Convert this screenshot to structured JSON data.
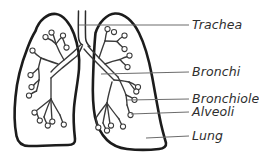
{
  "figure": {
    "background_color": "#ffffff",
    "outline_color": "#1c1c1c",
    "airway_color": "#3a3a3a",
    "leader_color": "#6d6d6d",
    "text_color": "#2e2e2e"
  },
  "labels": {
    "trachea": "Trachea",
    "bronchi": "Bronchi",
    "bronchioles": "Bronchioles",
    "alveoli": "Alveoli",
    "lung": "Lung"
  },
  "structures": [
    {
      "name": "trachea",
      "label": "Trachea",
      "description": "windpipe tube at top center"
    },
    {
      "name": "bronchi",
      "label": "Bronchi",
      "description": "two main branches entering each lung"
    },
    {
      "name": "bronchioles",
      "label": "Bronchioles",
      "description": "fine branching airways"
    },
    {
      "name": "alveoli",
      "label": "Alveoli",
      "description": "small sacs at the tips of bronchioles"
    },
    {
      "name": "lung",
      "label": "Lung",
      "description": "outer organ boundary"
    }
  ]
}
